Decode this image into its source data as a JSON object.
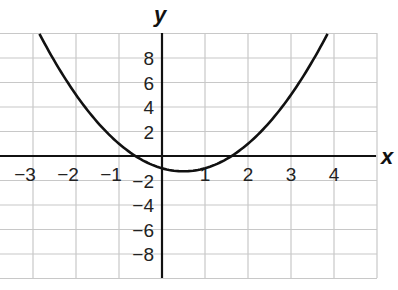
{
  "chart_data": {
    "type": "line",
    "title": "",
    "xlabel": "x",
    "ylabel": "y",
    "xlim": [
      -3.77,
      5
    ],
    "ylim": [
      -9.8,
      10
    ],
    "grid": true,
    "x_ticks": [
      -3,
      -2,
      -1,
      1,
      2,
      3,
      4
    ],
    "x_tick_labels": [
      "−3",
      "−2",
      "−1",
      "1",
      "2",
      "3",
      "4"
    ],
    "y_ticks": [
      8,
      6,
      4,
      2,
      -2,
      -4,
      -6,
      -8
    ],
    "y_tick_labels": [
      "8",
      "6",
      "4",
      "2",
      "−2",
      "−4",
      "−6",
      "−8"
    ],
    "series": [
      {
        "name": "parabola",
        "equation": "y = x^2 - x - 1",
        "x": [
          -2.85,
          -2,
          -1,
          -0.618,
          0,
          0.5,
          1,
          1.618,
          2,
          3,
          3.85
        ],
        "y": [
          10,
          5,
          1,
          0,
          -1,
          -1.25,
          -1,
          0,
          1,
          5,
          10
        ]
      }
    ],
    "annotations": []
  },
  "labels": {
    "x_axis": "x",
    "y_axis": "y"
  }
}
